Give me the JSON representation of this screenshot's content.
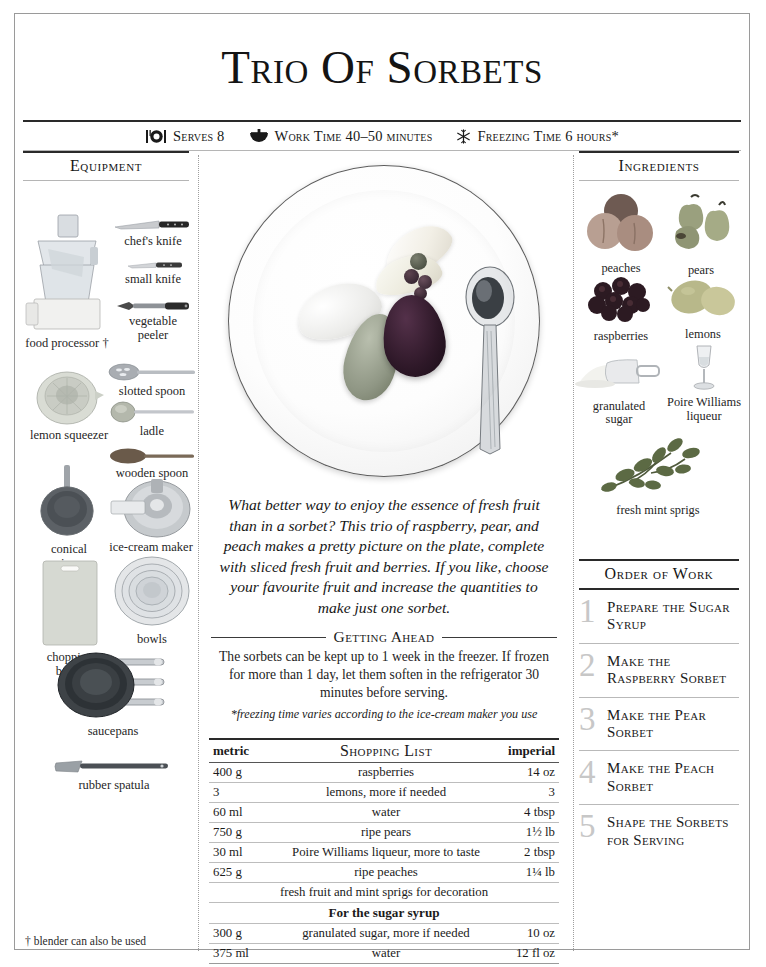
{
  "page": {
    "title": "Trio of Sorbets"
  },
  "meta": [
    {
      "icon": "plate-cutlery-icon",
      "text": "Serves 8"
    },
    {
      "icon": "mixing-bowl-icon",
      "text": "Work Time 40–50 minutes"
    },
    {
      "icon": "snowflake-icon",
      "text": "Freezing Time 6 hours*"
    }
  ],
  "equipment": {
    "heading": "Equipment",
    "items": [
      {
        "label": "chef's knife"
      },
      {
        "label": "small knife"
      },
      {
        "label": "vegetable\npeeler"
      },
      {
        "label": "food processor †"
      },
      {
        "label": "slotted spoon"
      },
      {
        "label": "ladle"
      },
      {
        "label": "lemon squeezer"
      },
      {
        "label": "wooden spoon"
      },
      {
        "label": "conical\nsieve"
      },
      {
        "label": "ice-cream maker"
      },
      {
        "label": "chopping\nboard"
      },
      {
        "label": "bowls"
      },
      {
        "label": "saucepans"
      },
      {
        "label": "rubber spatula"
      }
    ],
    "footnote": "† blender can also be used"
  },
  "photo": {
    "caption": "plate of three sorbet quenelles with pear slices, berries and a spoon"
  },
  "blurb": "What better way to enjoy the essence of fresh fruit than in a sorbet? This trio of raspberry, pear, and peach makes a pretty picture on the plate, complete with sliced fresh fruit and berries. If you like, choose your favourite fruit and increase the quantities to make just one sorbet.",
  "getting_ahead": {
    "heading": "Getting Ahead",
    "body": "The sorbets can be kept up to 1 week in the freezer. If frozen for more than 1 day, let them soften in the refrigerator 30 minutes before serving.",
    "note": "*freezing time varies according to the ice-cream maker you use"
  },
  "shopping_list": {
    "headers": {
      "metric": "metric",
      "title": "Shopping List",
      "imperial": "imperial"
    },
    "rows": [
      {
        "type": "item",
        "metric": "400 g",
        "item": "raspberries",
        "imperial": "14 oz"
      },
      {
        "type": "item",
        "metric": "3",
        "item": "lemons, more if needed",
        "imperial": "3"
      },
      {
        "type": "item",
        "metric": "60 ml",
        "item": "water",
        "imperial": "4 tbsp"
      },
      {
        "type": "item",
        "metric": "750 g",
        "item": "ripe pears",
        "imperial": "1½ lb"
      },
      {
        "type": "item",
        "metric": "30 ml",
        "item": "Poire Williams liqueur, more to taste",
        "imperial": "2 tbsp"
      },
      {
        "type": "item",
        "metric": "625 g",
        "item": "ripe peaches",
        "imperial": "1¼ lb"
      },
      {
        "type": "full",
        "item": "fresh fruit and mint sprigs for decoration"
      },
      {
        "type": "sub",
        "item": "For the sugar syrup"
      },
      {
        "type": "item",
        "metric": "300 g",
        "item": "granulated sugar, more if needed",
        "imperial": "10 oz"
      },
      {
        "type": "item",
        "metric": "375 ml",
        "item": "water",
        "imperial": "12 fl oz"
      }
    ]
  },
  "ingredients": {
    "heading": "Ingredients",
    "items": [
      {
        "label": "peaches"
      },
      {
        "label": "pears"
      },
      {
        "label": "raspberries"
      },
      {
        "label": "lemons"
      },
      {
        "label": "granulated\nsugar"
      },
      {
        "label": "Poire Williams\nliqueur"
      },
      {
        "label": "fresh mint sprigs"
      }
    ]
  },
  "order_of_work": {
    "heading": "Order of Work",
    "steps": [
      {
        "number": "1",
        "text": "Prepare the Sugar Syrup"
      },
      {
        "number": "2",
        "text": "Make the Raspberry Sorbet"
      },
      {
        "number": "3",
        "text": "Make the Pear Sorbet"
      },
      {
        "number": "4",
        "text": "Make the Peach Sorbet"
      },
      {
        "number": "5",
        "text": "Shape the Sorbets for Serving"
      }
    ]
  },
  "colors": {
    "ink": "#1b1b1b",
    "rule_dark": "#2a2a2a",
    "rule_light": "#b5b5b5",
    "numeral_gray": "#c7c7c7",
    "page_border": "#9a9a9a"
  }
}
